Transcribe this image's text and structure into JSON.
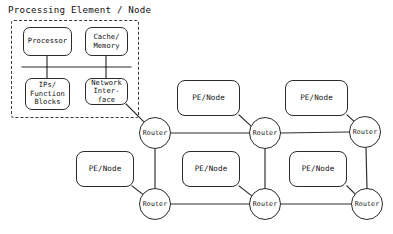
{
  "diagram": {
    "title": "Processing Element / Node",
    "type": "network-on-chip-mesh-topology",
    "pe_detail": {
      "boundary_style": "dashed",
      "blocks": [
        {
          "id": "processor",
          "label": "Processor",
          "lines": [
            "Processor"
          ]
        },
        {
          "id": "cache-memory",
          "label": "Cache/ Memory",
          "lines": [
            "Cache/",
            "Memory"
          ]
        },
        {
          "id": "ips-function",
          "label": "IPs/ Function Blocks",
          "lines": [
            "IPs/",
            "Function",
            "Blocks"
          ]
        },
        {
          "id": "network-interface",
          "label": "Network Interface",
          "lines": [
            "Network",
            "Inter-",
            "face"
          ]
        }
      ]
    },
    "mesh": {
      "router_label": "Router",
      "pe_label": "PE/Node",
      "routers": [
        {
          "id": "router-r0c0",
          "label": "Router",
          "row": 0,
          "col": 0
        },
        {
          "id": "router-r0c1",
          "label": "Router",
          "row": 0,
          "col": 1
        },
        {
          "id": "router-r0c2",
          "label": "Router",
          "row": 0,
          "col": 2
        },
        {
          "id": "router-r1c0",
          "label": "Router",
          "row": 1,
          "col": 0
        },
        {
          "id": "router-r1c1",
          "label": "Router",
          "row": 1,
          "col": 1
        },
        {
          "id": "router-r1c2",
          "label": "Router",
          "row": 1,
          "col": 2
        }
      ],
      "pe_nodes": [
        {
          "id": "pe-r0c1",
          "label": "PE/Node",
          "attached_router": "router-r0c1"
        },
        {
          "id": "pe-r0c2",
          "label": "PE/Node",
          "attached_router": "router-r0c2"
        },
        {
          "id": "pe-r1c0",
          "label": "PE/Node",
          "attached_router": "router-r1c0"
        },
        {
          "id": "pe-r1c1",
          "label": "PE/Node",
          "attached_router": "router-r1c1"
        },
        {
          "id": "pe-r1c2",
          "label": "PE/Node",
          "attached_router": "router-r1c2"
        }
      ]
    },
    "colors": {
      "stroke": "#2b2b2b",
      "dashed_stroke": "#3a3a3a",
      "text": "#111111",
      "background": "#ffffff"
    }
  }
}
